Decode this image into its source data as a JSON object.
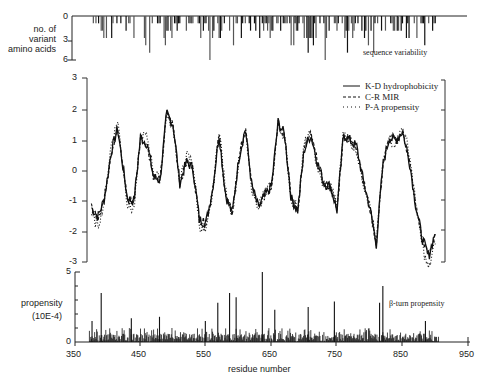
{
  "chart_data": [
    {
      "type": "bar",
      "panel": "top",
      "ylabel": "no. of variant amino acids",
      "annotation": "sequence variability",
      "yticks": [
        "0",
        "3",
        "6"
      ],
      "ylim": [
        0,
        6
      ],
      "inverted": true,
      "x_range": [
        375,
        900
      ],
      "note": "downward bars showing number of variant amino acids per residue; max ~6 near residue 555"
    },
    {
      "type": "line",
      "panel": "middle",
      "yticks": [
        "3",
        "2",
        "1",
        "0",
        "-1",
        "-2",
        "-3"
      ],
      "ylim": [
        -3,
        3
      ],
      "legend": [
        {
          "name": "K-D hydrophobicity",
          "style": "solid"
        },
        {
          "name": "C-R MIR",
          "style": "dashed"
        },
        {
          "name": "P-A propensity",
          "style": "dotted"
        }
      ],
      "series": [
        {
          "name": "K-D hydrophobicity",
          "x": [
            375,
            385,
            395,
            405,
            415,
            430,
            440,
            450,
            460,
            470,
            480,
            490,
            500,
            510,
            520,
            530,
            540,
            550,
            560,
            570,
            580,
            590,
            600,
            610,
            620,
            630,
            640,
            650,
            660,
            670,
            680,
            690,
            700,
            710,
            720,
            730,
            740,
            750,
            760,
            770,
            780,
            790,
            800,
            810,
            820,
            830,
            840,
            850,
            860,
            870,
            880,
            890,
            900
          ],
          "values": [
            -1.2,
            -1.5,
            -0.9,
            0.6,
            1.4,
            -0.9,
            -1.0,
            1.1,
            0.9,
            -0.2,
            -0.3,
            1.9,
            1.5,
            -0.4,
            0.3,
            0.1,
            -1.6,
            -1.7,
            -0.6,
            1.2,
            -0.8,
            -1.4,
            0.4,
            1.4,
            -0.5,
            -1.2,
            -0.8,
            -0.5,
            1.6,
            1.2,
            -0.9,
            -1.3,
            0.7,
            1.2,
            0.3,
            -0.4,
            -0.5,
            -1.3,
            1.2,
            1.0,
            0.8,
            -0.3,
            -1.2,
            -2.4,
            0.2,
            1.1,
            1.0,
            1.3,
            0.4,
            -1.1,
            -2.2,
            -2.8,
            -2.0
          ]
        }
      ],
      "description": "three overlapping periodic hydrophobicity/MIR/propensity profiles oscillating between about -2.8 and 2.3 with period ~50-60 residues"
    },
    {
      "type": "bar",
      "panel": "bottom",
      "ylabel": "propensity (10E-4)",
      "annotation": "β-turn propensity",
      "yticks": [
        "0",
        "5"
      ],
      "ylim": [
        0,
        5
      ],
      "xlabel": "residue number",
      "xticks": [
        "350",
        "450",
        "550",
        "650",
        "750",
        "850",
        "950"
      ],
      "xlim": [
        350,
        950
      ],
      "peaks": [
        {
          "x": 376,
          "value": 1.5
        },
        {
          "x": 390,
          "value": 3.5
        },
        {
          "x": 436,
          "value": 1.7
        },
        {
          "x": 479,
          "value": 1.8
        },
        {
          "x": 549,
          "value": 1.5
        },
        {
          "x": 568,
          "value": 2.8
        },
        {
          "x": 586,
          "value": 3.5
        },
        {
          "x": 596,
          "value": 3.2
        },
        {
          "x": 636,
          "value": 5.0
        },
        {
          "x": 655,
          "value": 2.3
        },
        {
          "x": 706,
          "value": 2.5
        },
        {
          "x": 746,
          "value": 2.9
        },
        {
          "x": 815,
          "value": 2.8
        },
        {
          "x": 820,
          "value": 4.0
        },
        {
          "x": 885,
          "value": 1.5
        }
      ]
    }
  ],
  "labels": {
    "top_ylabel_1": "no. of",
    "top_ylabel_2": "variant",
    "top_ylabel_3": "amino acids",
    "top_annotation": "sequence variability",
    "bottom_ylabel_1": "propensity",
    "bottom_ylabel_2": "(10E-4)",
    "bottom_annotation": "β-turn propensity",
    "xlabel": "residue number",
    "legend_1": "K-D hydrophobicity",
    "legend_2": "C-R MIR",
    "legend_3": "P-A propensity",
    "top_ticks": [
      "0",
      "3",
      "6"
    ],
    "mid_ticks": [
      "3",
      "2",
      "1",
      "0",
      "-1",
      "-2",
      "-3"
    ],
    "bot_ticks": [
      "5",
      "0"
    ],
    "x_ticks": [
      "350",
      "450",
      "550",
      "650",
      "750",
      "850",
      "950"
    ]
  }
}
